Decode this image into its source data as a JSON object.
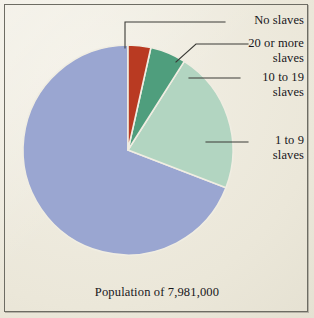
{
  "figure": {
    "caption": "Population of 7,981,000",
    "background_color": "#efece1",
    "border_color": "#6d6c63"
  },
  "chart_data": {
    "type": "pie",
    "title": "",
    "subtitle": "",
    "xlabel": "",
    "ylabel": "",
    "caption": "Population of 7,981,000",
    "total_population": 7981000,
    "legend_position": "callout-labels",
    "grid": false,
    "categories": [
      "No slaves",
      "20 or more slaves",
      "10 to 19 slaves",
      "1 to 9 slaves"
    ],
    "values": [
      69,
      3.5,
      5.5,
      22
    ],
    "value_unit": "percent",
    "colors": [
      "#9aa6d1",
      "#b93a22",
      "#4f9e7d",
      "#b2d5c1"
    ],
    "slices": [
      {
        "label": "No slaves",
        "percent": 69,
        "color": "#9aa6d1",
        "start_angle_deg": 111,
        "end_angle_deg": 360
      },
      {
        "label": "20 or more slaves",
        "percent": 3.5,
        "color": "#b93a22",
        "start_angle_deg": 0,
        "end_angle_deg": 12.6
      },
      {
        "label": "10 to 19 slaves",
        "percent": 5.5,
        "color": "#4f9e7d",
        "start_angle_deg": 12.6,
        "end_angle_deg": 32.4
      },
      {
        "label": "1 to 9 slaves",
        "percent": 22,
        "color": "#b2d5c1",
        "start_angle_deg": 32.4,
        "end_angle_deg": 111
      }
    ]
  },
  "callouts": {
    "no_slaves": "No slaves",
    "twenty_or_more": "20 or more\nslaves",
    "ten_to_nineteen": "10 to 19\nslaves",
    "one_to_nine": "1 to 9\nslaves"
  }
}
